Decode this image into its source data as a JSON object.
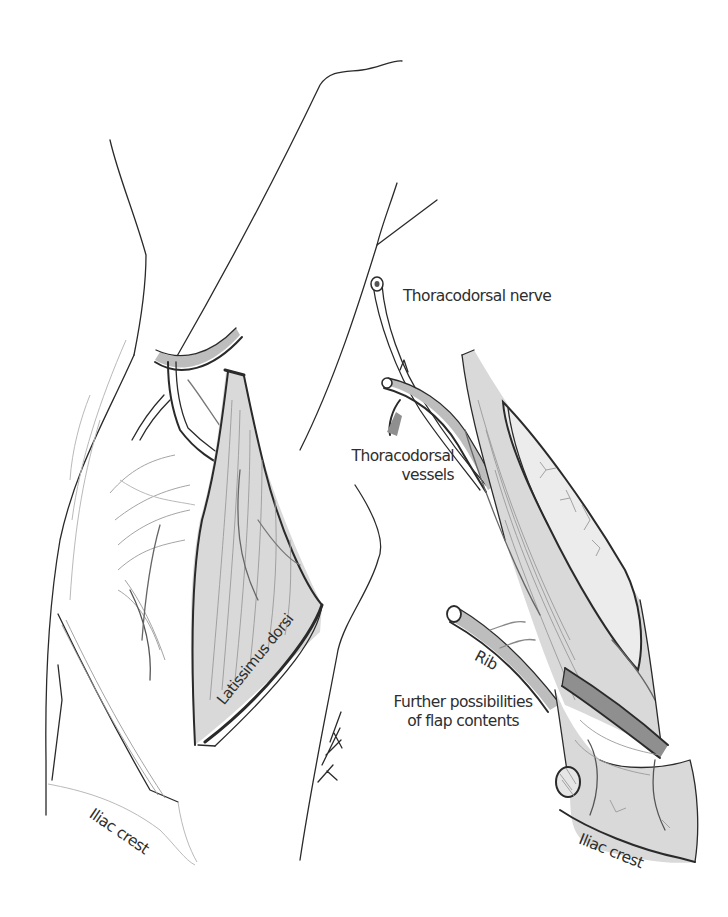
{
  "figure": {
    "labels": {
      "thoracodorsal_nerve": "Thoracodorsal nerve",
      "thoracodorsal_vessels_line1": "Thoracodorsal",
      "thoracodorsal_vessels_line2": "vessels",
      "latissimus_dorsi": "Latissimus dorsi",
      "rib": "Rib",
      "further_possibilities_line1": "Further possibilities",
      "further_possibilities_line2": "of flap contents",
      "iliac_crest_left": "Iliac crest",
      "iliac_crest_right": "Iliac crest",
      "signature": "KGK"
    },
    "colors": {
      "ink": "#2a2a2a",
      "text": "#2e2e2e",
      "shade_light": "#d9d9d9",
      "shade_mid": "#bdbdbd",
      "shade_dark": "#8f8f8f",
      "background": "#ffffff"
    }
  }
}
